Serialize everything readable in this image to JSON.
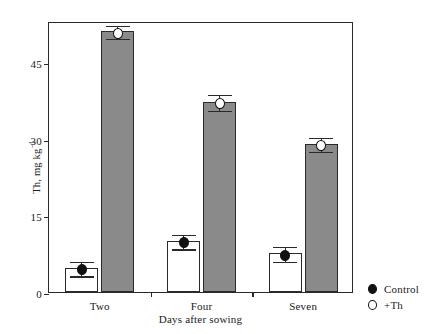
{
  "chart_data": {
    "type": "bar",
    "title": "",
    "subtitle": "",
    "xlabel": "Days after sowing",
    "ylabel": "Th, mg kg",
    "ylabel_exponent": "-1",
    "categories": [
      "Two",
      "Four",
      "Seven"
    ],
    "ylim": [
      0,
      53
    ],
    "yticks": [
      0,
      15,
      30,
      45
    ],
    "ytick_labels": [
      "0",
      "15",
      "30",
      "45"
    ],
    "grid": false,
    "legend_position": "right-bottom-outside",
    "series": [
      {
        "name": "Control",
        "marker": "filled-circle",
        "bar_fill": "#ffffff",
        "values": [
          4.7,
          10.0,
          7.6
        ],
        "errors": [
          1.5,
          1.5,
          1.6
        ]
      },
      {
        "name": "+Th",
        "marker": "open-circle",
        "bar_fill": "#8a8a8a",
        "values": [
          51.0,
          37.2,
          29.0
        ],
        "errors": [
          1.4,
          1.7,
          1.5
        ]
      }
    ]
  },
  "axes": {
    "y_title_main": "Th, mg kg",
    "y_title_sup": "−1",
    "x_title": "Days after sowing",
    "y_ticks": [
      {
        "label": "45",
        "value": 45
      },
      {
        "label": "30",
        "value": 30
      },
      {
        "label": "15",
        "value": 15
      },
      {
        "label": "0",
        "value": 0
      }
    ],
    "x_groups": [
      {
        "label": "Two"
      },
      {
        "label": "Four"
      },
      {
        "label": "Seven"
      }
    ]
  },
  "legend": {
    "entries": [
      {
        "label": "Control",
        "marker": "filled-circle"
      },
      {
        "label": "+Th",
        "marker": "open-circle"
      }
    ]
  },
  "colors": {
    "bar_treated": "#8a8a8a",
    "bar_control": "#ffffff",
    "axis": "#2a2a2a",
    "marker": "#111111",
    "background": "#ffffff"
  }
}
